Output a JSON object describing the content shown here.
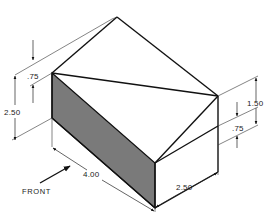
{
  "figure": {
    "type": "isometric-technical-drawing"
  },
  "colors": {
    "edge": "#111111",
    "shaded_face": "#7a7a7a",
    "background": "#ffffff"
  },
  "dimensions": {
    "left_top_offset": ".75",
    "overall_height": "2.50",
    "length": "4.00",
    "width": "2.50",
    "right_upper": "1.50",
    "right_lower": ".75"
  },
  "labels": {
    "front": "FRONT"
  }
}
